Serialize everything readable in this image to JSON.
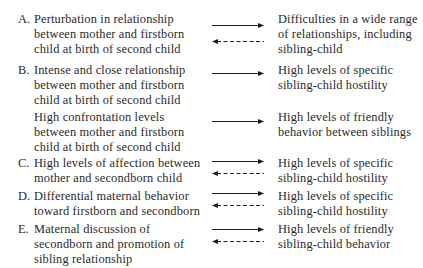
{
  "rows": [
    {
      "letter": "A.",
      "cause": [
        "Perturbation in relationship",
        "between mother and firstborn",
        "child at birth of second child"
      ],
      "effect": [
        "Difficulties in a wide range",
        "of relationships, including",
        "sibling-child"
      ],
      "arrows": [
        "forward-solid",
        "backward-dashed"
      ]
    },
    {
      "letter": "B.",
      "cause": [
        "Intense and close relationship",
        "between mother and firstborn",
        "child at birth of second child"
      ],
      "effect": [
        "High levels of specific",
        "sibling-child hostility"
      ],
      "arrows": [
        "forward-solid"
      ]
    },
    {
      "letter": "",
      "cause": [
        "High confrontation levels",
        "between mother and firstborn",
        "child at birth of second child"
      ],
      "effect": [
        "High levels of friendly",
        "behavior between siblings"
      ],
      "arrows": [
        "forward-solid"
      ]
    },
    {
      "letter": "C.",
      "cause": [
        "High levels of affection between",
        "mother and secondborn child"
      ],
      "effect": [
        "High levels of specific",
        "sibling-child hostility"
      ],
      "arrows": [
        "forward-solid",
        "backward-dashed"
      ]
    },
    {
      "letter": "D.",
      "cause": [
        "Differential maternal behavior",
        "toward firstborn and secondborn"
      ],
      "effect": [
        "High levels of specific",
        "sibling-child hostility"
      ],
      "arrows": [
        "forward-solid",
        "backward-dashed"
      ]
    },
    {
      "letter": "E.",
      "cause": [
        "Maternal discussion of",
        "secondborn and promotion of",
        "sibling relationship"
      ],
      "effect": [
        "High levels of friendly",
        "sibling-child behavior"
      ],
      "arrows": [
        "forward-solid",
        "backward-dashed"
      ]
    }
  ],
  "colors": {
    "text": "#2a2a2a",
    "arrow": "#1a1a1a",
    "background": "#ffffff"
  }
}
